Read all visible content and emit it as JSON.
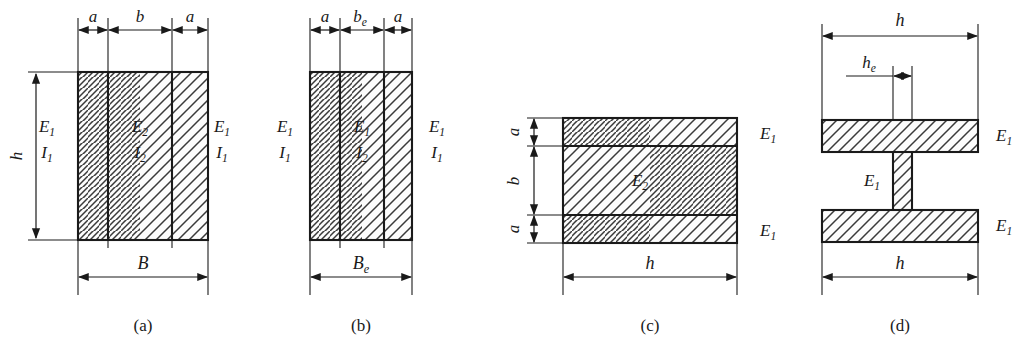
{
  "figure": {
    "background_color": "#ffffff",
    "line_color": "#1a1a1a",
    "hatch_color": "#3a3a3a",
    "fill_color": "#fcfcfc"
  },
  "panels": [
    {
      "id": "a",
      "caption": "(a)",
      "top_dimensions": [
        {
          "name": "a-left",
          "label": "a",
          "sub": ""
        },
        {
          "name": "b",
          "label": "b",
          "sub": ""
        },
        {
          "name": "a-right",
          "label": "a",
          "sub": ""
        }
      ],
      "left_dimension": {
        "label": "h",
        "sub": "",
        "rotated": true
      },
      "bottom_dimension": {
        "label": "B",
        "sub": ""
      },
      "material_labels": [
        {
          "name": "left-outer",
          "modulus": "E",
          "modulus_sub": "1",
          "inertia": "I",
          "inertia_sub": "1"
        },
        {
          "name": "center",
          "modulus": "E",
          "modulus_sub": "2",
          "inertia": "I",
          "inertia_sub": "2"
        },
        {
          "name": "right-outer",
          "modulus": "E",
          "modulus_sub": "1",
          "inertia": "I",
          "inertia_sub": "1"
        }
      ]
    },
    {
      "id": "b",
      "caption": "(b)",
      "top_dimensions": [
        {
          "name": "a-left",
          "label": "a",
          "sub": ""
        },
        {
          "name": "be",
          "label": "b",
          "sub": "e"
        },
        {
          "name": "a-right",
          "label": "a",
          "sub": ""
        }
      ],
      "left_dimension": null,
      "bottom_dimension": {
        "label": "B",
        "sub": "e"
      },
      "material_labels": [
        {
          "name": "left-outer",
          "modulus": "E",
          "modulus_sub": "1",
          "inertia": "I",
          "inertia_sub": "1"
        },
        {
          "name": "center",
          "modulus": "E",
          "modulus_sub": "1",
          "inertia": "I",
          "inertia_sub": "2"
        },
        {
          "name": "right-outer",
          "modulus": "E",
          "modulus_sub": "1",
          "inertia": "I",
          "inertia_sub": "1"
        }
      ]
    },
    {
      "id": "c",
      "caption": "(c)",
      "left_dimensions": [
        {
          "name": "a-top",
          "label": "a",
          "sub": "",
          "rotated": true
        },
        {
          "name": "b-mid",
          "label": "b",
          "sub": "",
          "rotated": true
        },
        {
          "name": "a-bottom",
          "label": "a",
          "sub": "",
          "rotated": true
        }
      ],
      "bottom_dimension": {
        "label": "h",
        "sub": ""
      },
      "material_labels": [
        {
          "name": "top-flange",
          "modulus": "E",
          "modulus_sub": "1"
        },
        {
          "name": "core",
          "modulus": "E",
          "modulus_sub": "2"
        },
        {
          "name": "bottom-flange",
          "modulus": "E",
          "modulus_sub": "1"
        }
      ]
    },
    {
      "id": "d",
      "caption": "(d)",
      "top_dimension": {
        "label": "h",
        "sub": ""
      },
      "web_dimension": {
        "label": "h",
        "sub": "e"
      },
      "bottom_dimension": {
        "label": "h",
        "sub": ""
      },
      "material_labels": [
        {
          "name": "top-flange",
          "modulus": "E",
          "modulus_sub": "1"
        },
        {
          "name": "web",
          "modulus": "E",
          "modulus_sub": "1"
        },
        {
          "name": "bottom-flange",
          "modulus": "E",
          "modulus_sub": "1"
        }
      ]
    }
  ]
}
